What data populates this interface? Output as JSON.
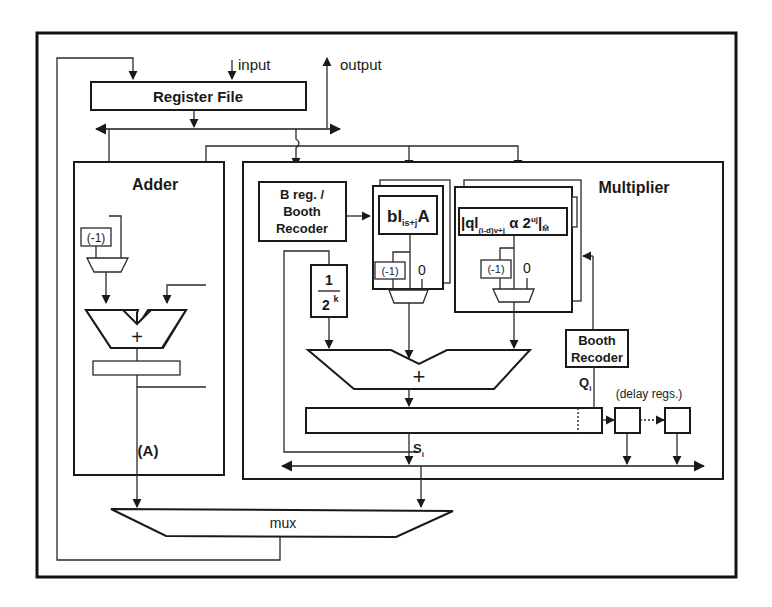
{
  "diagram": {
    "io": {
      "input_label": "input",
      "output_label": "output"
    },
    "register_file": {
      "label": "Register File"
    },
    "adder": {
      "title": "Adder",
      "negate_label": "(-1)",
      "sum_symbol": "+",
      "output_label": "(A)"
    },
    "multiplier": {
      "title": "Multiplier",
      "b_reg": {
        "line1": "B reg. /",
        "line2": "Booth",
        "line3": "Recoder"
      },
      "scale": {
        "numerator": "1",
        "denominator": "2",
        "exponent": "k"
      },
      "partial_a": {
        "main": "bl",
        "sub": "is+j",
        "suffix": "A",
        "negate_label": "(-1)",
        "zero_label": "0"
      },
      "partial_q": {
        "main": "|ql",
        "sub": "(i-d)v+j",
        "middle": " α 2",
        "sup": "uj",
        "close": "|",
        "mod_sub": "M̂",
        "negate_label": "(-1)",
        "zero_label": "0"
      },
      "sum_symbol": "+",
      "booth_recoder": {
        "line1": "Booth",
        "line2": "Recoder"
      },
      "q_label": "Q",
      "q_sub": "i",
      "s_label": "S",
      "s_sub": "i",
      "delay_label": "(delay regs.)"
    },
    "mux": {
      "label": "mux"
    },
    "colors": {
      "stroke": "#1a1a1a",
      "background": "#ffffff"
    }
  }
}
